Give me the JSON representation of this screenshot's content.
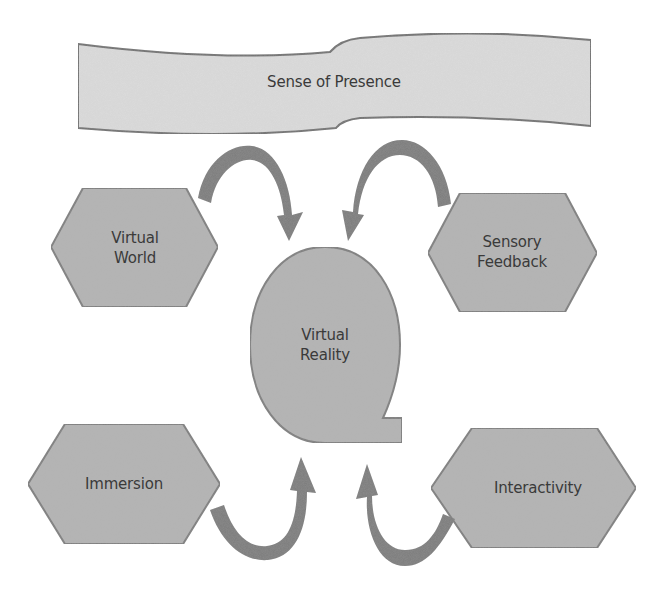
{
  "diagram": {
    "title": "Sense of Presence",
    "center": {
      "line1": "Virtual",
      "line2": "Reality"
    },
    "nodes": [
      {
        "id": "virtual-world",
        "line1": "Virtual",
        "line2": "World",
        "position": "upper-left"
      },
      {
        "id": "sensory-feedback",
        "line1": "Sensory",
        "line2": "Feedback",
        "position": "upper-right"
      },
      {
        "id": "immersion",
        "line1": "Immersion",
        "line2": "",
        "position": "lower-left"
      },
      {
        "id": "interactivity",
        "line1": "Interactivity",
        "line2": "",
        "position": "lower-right"
      }
    ],
    "arrows": [
      {
        "from": "virtual-world",
        "to": "virtual-reality",
        "direction": "clockwise-down"
      },
      {
        "from": "sensory-feedback",
        "to": "virtual-reality",
        "direction": "counterclockwise-down"
      },
      {
        "from": "immersion",
        "to": "virtual-reality",
        "direction": "counterclockwise-up"
      },
      {
        "from": "interactivity",
        "to": "virtual-reality",
        "direction": "clockwise-up"
      }
    ]
  },
  "colors": {
    "banner_fill": "#dcdcdc",
    "banner_stroke": "#6e6e6e",
    "node_fill": "#b3b3b3",
    "node_stroke": "#7c7c7c",
    "arrow_fill": "#7a7a7a",
    "text": "#3a3a3a",
    "background": "#ffffff"
  }
}
